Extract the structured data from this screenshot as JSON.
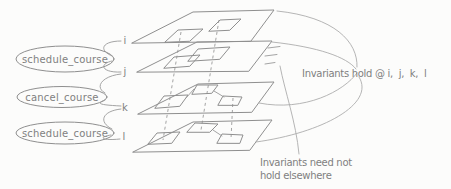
{
  "events": {
    "items": [
      {
        "label": "schedule_course"
      },
      {
        "label": "cancel_course"
      },
      {
        "label": "schedule_course"
      }
    ]
  },
  "timeline": {
    "labels": [
      "i",
      "j",
      "k",
      "l"
    ]
  },
  "annotations": {
    "invariants_hold": "Invariants hold @ i,  j,  k,  l",
    "invariants_not_line1": "Invariants need not",
    "invariants_not_line2": "hold elsewhere"
  },
  "colors": {
    "line": "#8f8f8f",
    "arc": "#adadad",
    "text": "#808080",
    "background": "#fcfcfb"
  }
}
